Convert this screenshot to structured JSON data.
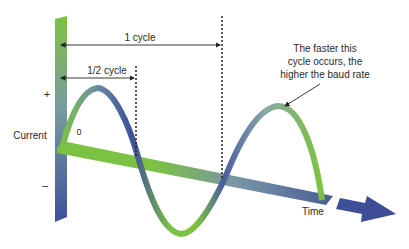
{
  "diagram": {
    "labels": {
      "one_cycle": "1 cycle",
      "half_cycle": "1/2 cycle",
      "plus": "+",
      "minus": "–",
      "zero": "0",
      "current": "Current",
      "time": "Time",
      "note_line1": "The faster this",
      "note_line2": "cycle occurs, the",
      "note_line3": "higher the baud rate"
    },
    "colors": {
      "green": "#7cc242",
      "blue": "#3d4f9a",
      "slate": "#6f8fa0",
      "text": "#2a2a2a"
    },
    "wave": {
      "type": "sine",
      "cycles": 1.25,
      "description": "Sine wave of current over time; one full cycle marked between dotted lines"
    }
  }
}
